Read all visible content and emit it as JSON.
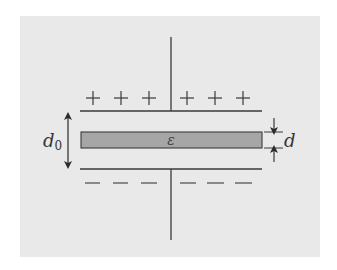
{
  "diagram": {
    "colors": {
      "background": "#e9e9e9",
      "line": "#3a3a3a",
      "slab_fill": "#a6a6a6"
    },
    "top_plate": {
      "charge_symbol": "+",
      "count": 6
    },
    "bottom_plate": {
      "charge_symbol": "−",
      "count": 6
    },
    "slab": {
      "label": "ε"
    },
    "gap_dimension": {
      "label": "d",
      "subscript": "0"
    },
    "slab_dimension": {
      "label": "d"
    }
  }
}
